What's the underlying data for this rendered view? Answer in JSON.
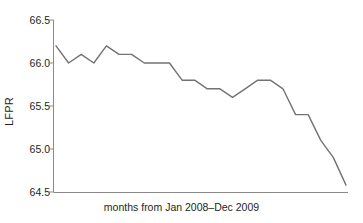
{
  "chart_data": {
    "type": "line",
    "title": "",
    "xlabel": "months from Jan 2008–Dec 2009",
    "ylabel": "LFPR",
    "ylim": [
      64.5,
      66.5
    ],
    "yticks": [
      "66.5",
      "66.0",
      "65.5",
      "65.0",
      "64.5"
    ],
    "ytick_values": [
      66.5,
      66.0,
      65.5,
      65.0,
      64.5
    ],
    "xticks": [],
    "grid": false,
    "legend": false,
    "line_color": "#737373",
    "axis_color": "#8a8a8a",
    "categories": [
      "Jan 2008",
      "Feb 2008",
      "Mar 2008",
      "Apr 2008",
      "May 2008",
      "Jun 2008",
      "Jul 2008",
      "Aug 2008",
      "Sep 2008",
      "Oct 2008",
      "Nov 2008",
      "Dec 2008",
      "Jan 2009",
      "Feb 2009",
      "Mar 2009",
      "Apr 2009",
      "May 2009",
      "Jun 2009",
      "Jul 2009",
      "Aug 2009",
      "Sep 2009",
      "Oct 2009",
      "Nov 2009",
      "Dec 2009"
    ],
    "values": [
      66.2,
      66.0,
      66.1,
      66.0,
      66.2,
      66.1,
      66.1,
      66.0,
      66.0,
      66.0,
      65.8,
      65.8,
      65.7,
      65.7,
      65.6,
      65.7,
      65.8,
      65.8,
      65.7,
      65.4,
      65.4,
      65.1,
      64.9,
      64.58
    ]
  },
  "axes": {
    "y_title": "LFPR",
    "x_title": "months from Jan 2008–Dec 2009"
  }
}
